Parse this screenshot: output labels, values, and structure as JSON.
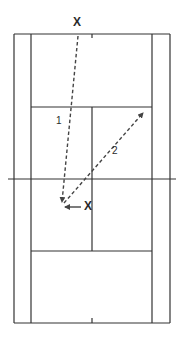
{
  "diagram": {
    "type": "tennis-court-drill",
    "colors": {
      "line": "#333333",
      "arrow": "#444444",
      "text": "#2a2a2a",
      "background": "#ffffff"
    },
    "court": {
      "outer_left": 14,
      "singles_left": 31,
      "center_x": 92,
      "singles_right": 152,
      "outer_right": 170,
      "baseline_top": 34,
      "service_top": 107,
      "net_y": 179,
      "service_bottom": 251,
      "baseline_bottom": 323,
      "net_left": 8,
      "net_right": 176
    },
    "players": [
      {
        "label": "X",
        "role": "feeder",
        "x": 77,
        "y": 26
      },
      {
        "label": "X",
        "role": "player",
        "x": 87,
        "y": 207
      }
    ],
    "shots": [
      {
        "label": "1",
        "from": [
          78,
          36
        ],
        "to": [
          62,
          202
        ],
        "label_pos": [
          59,
          121
        ],
        "style": "dashed"
      },
      {
        "label": "2",
        "from": [
          64,
          203
        ],
        "to": [
          143,
          113
        ],
        "label_pos": [
          115,
          151
        ],
        "style": "dashed"
      }
    ],
    "movement": {
      "from": [
        81,
        207
      ],
      "to": [
        65,
        207
      ],
      "style": "solid"
    }
  }
}
